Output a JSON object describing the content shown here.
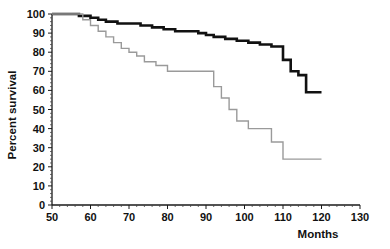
{
  "chart_data": {
    "type": "line",
    "title": "",
    "subtitle": "",
    "xlabel": "Months",
    "ylabel": "Percent survival",
    "xlim": [
      50,
      130
    ],
    "ylim": [
      0,
      100
    ],
    "xticks": [
      50,
      60,
      70,
      80,
      90,
      100,
      110,
      120,
      130
    ],
    "yticks": [
      0,
      10,
      20,
      30,
      40,
      50,
      60,
      70,
      80,
      90,
      100
    ],
    "xtick_labels": [
      "50",
      "60",
      "70",
      "80",
      "90",
      "100",
      "110",
      "120",
      "130"
    ],
    "ytick_labels": [
      "0",
      "10",
      "20",
      "30",
      "40",
      "50",
      "60",
      "70",
      "80",
      "90",
      "100"
    ],
    "grid": false,
    "legend": "none",
    "minor_ticks": true,
    "series": [
      {
        "name": "black-curve",
        "style": "step-post",
        "color": "#111111",
        "line_width": 2.6,
        "x": [
          50,
          54,
          57,
          60,
          62,
          64,
          67,
          70,
          73,
          76,
          79,
          82,
          85,
          88,
          90,
          92,
          95,
          98,
          101,
          104,
          107,
          110,
          112,
          114,
          116,
          120
        ],
        "y": [
          100,
          100,
          99,
          98,
          97,
          96,
          95,
          95,
          94,
          93,
          92,
          91,
          91,
          90,
          89,
          88,
          87,
          86,
          85,
          84,
          83,
          76,
          70,
          68,
          59,
          59
        ]
      },
      {
        "name": "gray-curve",
        "style": "step-post",
        "color": "#9a9a9a",
        "line_width": 1.4,
        "x": [
          50,
          55,
          58,
          60,
          62,
          64,
          66,
          68,
          70,
          72,
          74,
          77,
          80,
          84,
          88,
          90,
          92,
          94,
          96,
          98,
          101,
          104,
          107,
          110,
          120
        ],
        "y": [
          100,
          100,
          97,
          94,
          91,
          88,
          85,
          82,
          80,
          78,
          75,
          73,
          70,
          70,
          70,
          70,
          62,
          56,
          50,
          44,
          40,
          40,
          33,
          24,
          24
        ]
      }
    ]
  },
  "axis": {
    "x_title": "Months",
    "y_title": "Percent survival"
  }
}
